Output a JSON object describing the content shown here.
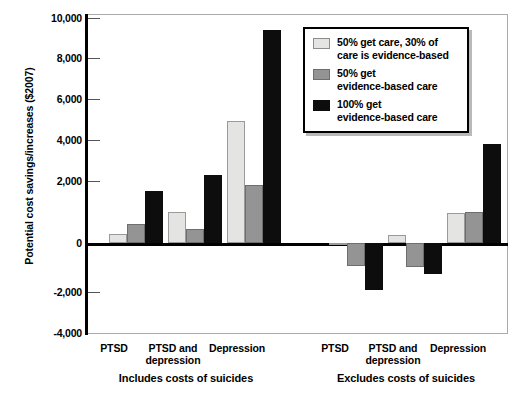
{
  "chart_data": {
    "type": "bar",
    "title": "",
    "xlabel": "",
    "ylabel": "Potential cost savings/increases ($2007)",
    "ylim": [
      -4000,
      10000
    ],
    "ytick_values": [
      10000,
      8000,
      6000,
      4000,
      2000,
      0,
      -2000,
      -4000
    ],
    "ytick_labels": [
      "10,000",
      "8,000",
      "6,000",
      "4,000",
      "2,000",
      "0",
      "-2,000",
      "-4,000"
    ],
    "grid": false,
    "legend_position": "upper right",
    "categories": [
      "PTSD",
      "PTSD and depression",
      "Depression",
      "PTSD",
      "PTSD and depression",
      "Depression"
    ],
    "group_labels": [
      "Includes costs of suicides",
      "Excludes costs of suicides"
    ],
    "series": [
      {
        "name": "50% get care, 30% of care is evidence-based",
        "color": "#e4e4e2",
        "values": [
          400,
          1350,
          5350,
          -50,
          350,
          1300
        ]
      },
      {
        "name": "50% get evidence-based care",
        "color": "#949494",
        "values": [
          850,
          600,
          2550,
          -1000,
          -1050,
          1350
        ]
      },
      {
        "name": "100% get evidence-based care",
        "color": "#0d0d0d",
        "values": [
          2300,
          3000,
          9350,
          -2050,
          -1350,
          4350
        ]
      }
    ]
  },
  "axis": {
    "y_title": "Potential cost savings/increases ($2007)"
  },
  "legend": {
    "items": [
      {
        "label_line1": "50% get care, 30% of",
        "label_line2": "care is evidence-based",
        "swatch": "light-gray-swatch"
      },
      {
        "label_line1": "50% get",
        "label_line2": "evidence-based care",
        "swatch": "medium-gray-swatch"
      },
      {
        "label_line1": "100% get",
        "label_line2": "evidence-based care",
        "swatch": "black-swatch"
      }
    ]
  },
  "x_axis": {
    "categories": [
      {
        "line1": "PTSD",
        "line2": ""
      },
      {
        "line1": "PTSD and",
        "line2": "depression"
      },
      {
        "line1": "Depression",
        "line2": ""
      },
      {
        "line1": "PTSD",
        "line2": ""
      },
      {
        "line1": "PTSD and",
        "line2": "depression"
      },
      {
        "line1": "Depression",
        "line2": ""
      }
    ],
    "groups": [
      {
        "label": "Includes costs of suicides"
      },
      {
        "label": "Excludes costs of suicides"
      }
    ]
  }
}
